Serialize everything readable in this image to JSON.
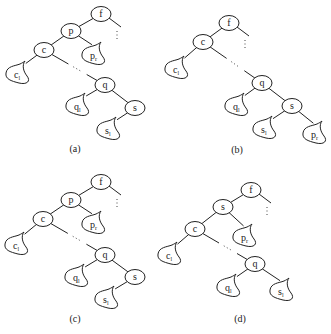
{
  "figure": {
    "panels": [
      {
        "id": "a",
        "caption": "(a)",
        "caption_pos": [
          75,
          152
        ],
        "nodes": [
          {
            "id": "f",
            "label": "f",
            "x": 101,
            "y": 14
          },
          {
            "id": "p",
            "label": "p",
            "x": 71,
            "y": 31
          },
          {
            "id": "c",
            "label": "c",
            "x": 44,
            "y": 50
          },
          {
            "id": "q",
            "label": "q",
            "x": 105,
            "y": 85
          },
          {
            "id": "s",
            "label": "s",
            "x": 135,
            "y": 108
          }
        ],
        "subtrees": [
          {
            "id": "c_l",
            "base": "c",
            "sub": "l",
            "x": 21,
            "y": 75,
            "parent": "c"
          },
          {
            "id": "p_r",
            "base": "p",
            "sub": "r",
            "x": 97,
            "y": 56,
            "parent": "p"
          },
          {
            "id": "q_l",
            "base": "q",
            "sub": "l",
            "x": 81,
            "y": 107,
            "parent": "q"
          },
          {
            "id": "s_l",
            "base": "s",
            "sub": "l",
            "x": 112,
            "y": 131,
            "parent": "s"
          }
        ],
        "edges": [
          [
            "f",
            "p"
          ],
          [
            "p",
            "c"
          ],
          [
            "p",
            "p_r"
          ],
          [
            "c",
            "c_l"
          ],
          [
            "q",
            "q_l"
          ],
          [
            "q",
            "s"
          ],
          [
            "s",
            "s_l"
          ]
        ],
        "dotted_path": {
          "from": "c",
          "to": "q"
        },
        "up_link": {
          "from": "f"
        }
      },
      {
        "id": "b",
        "caption": "(b)",
        "caption_pos": [
          237,
          153
        ],
        "nodes": [
          {
            "id": "f",
            "label": "f",
            "x": 229,
            "y": 23
          },
          {
            "id": "c",
            "label": "c",
            "x": 203,
            "y": 42
          },
          {
            "id": "q",
            "label": "q",
            "x": 262,
            "y": 83
          },
          {
            "id": "s",
            "label": "s",
            "x": 292,
            "y": 106
          }
        ],
        "subtrees": [
          {
            "id": "c_l",
            "base": "c",
            "sub": "l",
            "x": 180,
            "y": 70,
            "parent": "c"
          },
          {
            "id": "q_l",
            "base": "q",
            "sub": "l",
            "x": 240,
            "y": 107,
            "parent": "q"
          },
          {
            "id": "s_l",
            "base": "s",
            "sub": "l",
            "x": 268,
            "y": 130,
            "parent": "s"
          },
          {
            "id": "p_r",
            "base": "p",
            "sub": "r",
            "x": 318,
            "y": 135,
            "parent": "s"
          }
        ],
        "edges": [
          [
            "f",
            "c"
          ],
          [
            "c",
            "c_l"
          ],
          [
            "q",
            "q_l"
          ],
          [
            "q",
            "s"
          ],
          [
            "s",
            "s_l"
          ],
          [
            "s",
            "p_r"
          ]
        ],
        "dotted_path": {
          "from": "c",
          "to": "q"
        },
        "up_link": {
          "from": "f"
        }
      },
      {
        "id": "c",
        "caption": "(c)",
        "caption_pos": [
          75,
          322
        ],
        "nodes": [
          {
            "id": "f",
            "label": "f",
            "x": 101,
            "y": 182
          },
          {
            "id": "p",
            "label": "p",
            "x": 71,
            "y": 200
          },
          {
            "id": "c",
            "label": "c",
            "x": 43,
            "y": 219
          },
          {
            "id": "q",
            "label": "q",
            "x": 105,
            "y": 255
          },
          {
            "id": "s",
            "label": "s",
            "x": 135,
            "y": 277
          }
        ],
        "subtrees": [
          {
            "id": "c_l",
            "base": "c",
            "sub": "l",
            "x": 20,
            "y": 246,
            "parent": "c"
          },
          {
            "id": "p_r",
            "base": "p",
            "sub": "r",
            "x": 97,
            "y": 225,
            "parent": "p"
          },
          {
            "id": "q_l",
            "base": "q",
            "sub": "l",
            "x": 80,
            "y": 278,
            "parent": "q"
          },
          {
            "id": "s_l",
            "base": "s",
            "sub": "l",
            "x": 110,
            "y": 300,
            "parent": "s"
          }
        ],
        "edges": [
          [
            "f",
            "p"
          ],
          [
            "p",
            "c"
          ],
          [
            "p",
            "p_r"
          ],
          [
            "c",
            "c_l"
          ],
          [
            "q",
            "q_l"
          ],
          [
            "q",
            "s"
          ],
          [
            "s",
            "s_l"
          ]
        ],
        "dotted_path": {
          "from": "c",
          "to": "q"
        },
        "up_link": {
          "from": "f"
        }
      },
      {
        "id": "d",
        "caption": "(d)",
        "caption_pos": [
          240,
          322
        ],
        "nodes": [
          {
            "id": "f",
            "label": "f",
            "x": 251,
            "y": 190
          },
          {
            "id": "s",
            "label": "s",
            "x": 223,
            "y": 207
          },
          {
            "id": "c",
            "label": "c",
            "x": 195,
            "y": 229
          },
          {
            "id": "q",
            "label": "q",
            "x": 255,
            "y": 264
          }
        ],
        "subtrees": [
          {
            "id": "c_l",
            "base": "c",
            "sub": "l",
            "x": 173,
            "y": 256,
            "parent": "c"
          },
          {
            "id": "p_r",
            "base": "p",
            "sub": "r",
            "x": 248,
            "y": 238,
            "parent": "s"
          },
          {
            "id": "q_l",
            "base": "q",
            "sub": "l",
            "x": 232,
            "y": 288,
            "parent": "q"
          },
          {
            "id": "s_l",
            "base": "s",
            "sub": "l",
            "x": 285,
            "y": 292,
            "parent": "q"
          }
        ],
        "edges": [
          [
            "f",
            "s"
          ],
          [
            "s",
            "c"
          ],
          [
            "s",
            "p_r"
          ],
          [
            "c",
            "c_l"
          ],
          [
            "q",
            "q_l"
          ],
          [
            "q",
            "s_l"
          ]
        ],
        "dotted_path": {
          "from": "c",
          "to": "q"
        },
        "up_link": {
          "from": "f"
        }
      }
    ]
  }
}
